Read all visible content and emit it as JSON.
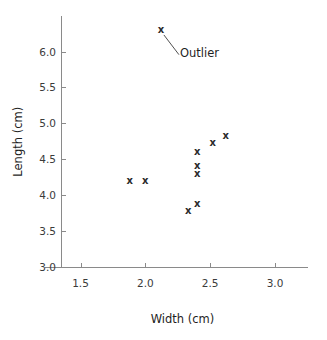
{
  "chart_data": {
    "type": "scatter",
    "title": "",
    "xlabel": "Width (cm)",
    "ylabel": "Length (cm)",
    "xlim": [
      1.23,
      3.27
    ],
    "ylim": [
      3.0,
      6.45
    ],
    "xticks": [
      "1.5",
      "2.0",
      "2.5",
      "3.0"
    ],
    "xtick_values": [
      1.5,
      2.0,
      2.5,
      3.0
    ],
    "yticks": [
      "3.0",
      "3.5",
      "4.0",
      "4.5",
      "5.0",
      "5.5",
      "6.0"
    ],
    "ytick_values": [
      3.0,
      3.5,
      4.0,
      4.5,
      5.0,
      5.5,
      6.0
    ],
    "grid": false,
    "legend": null,
    "marker": "x",
    "marker_color": "#2b2b2b",
    "axis_color": "#8a8a8a",
    "background": "#ffffff",
    "x": [
      1.88,
      2.0,
      2.33,
      2.4,
      2.4,
      2.4,
      2.4,
      2.52,
      2.62,
      2.12
    ],
    "y": [
      4.2,
      4.2,
      3.78,
      3.88,
      4.3,
      4.4,
      4.6,
      4.72,
      4.82,
      6.3
    ],
    "points": [
      {
        "x": 1.88,
        "y": 4.2,
        "label": ""
      },
      {
        "x": 2.0,
        "y": 4.2,
        "label": ""
      },
      {
        "x": 2.33,
        "y": 3.78,
        "label": ""
      },
      {
        "x": 2.4,
        "y": 3.88,
        "label": ""
      },
      {
        "x": 2.4,
        "y": 4.3,
        "label": ""
      },
      {
        "x": 2.4,
        "y": 4.4,
        "label": ""
      },
      {
        "x": 2.4,
        "y": 4.6,
        "label": ""
      },
      {
        "x": 2.52,
        "y": 4.72,
        "label": ""
      },
      {
        "x": 2.62,
        "y": 4.82,
        "label": ""
      },
      {
        "x": 2.12,
        "y": 6.3,
        "label": "Outlier"
      }
    ],
    "annotations": [
      {
        "text": "Outlier",
        "point_x": 2.12,
        "point_y": 6.3,
        "text_x": 2.29,
        "text_y": 5.97
      }
    ]
  }
}
